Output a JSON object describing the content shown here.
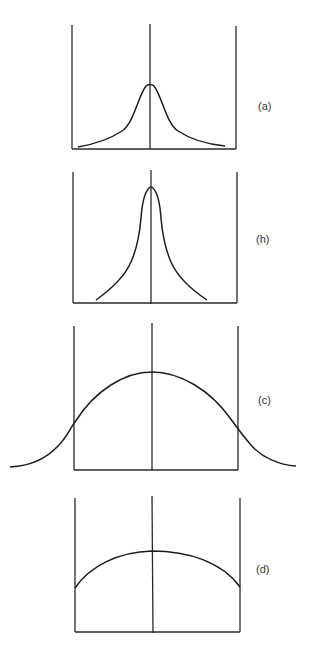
{
  "figure": {
    "colors": {
      "line": "#1e1e1e",
      "background": "#ffffff",
      "label": "#333333"
    },
    "panels": [
      {
        "id": "a",
        "label": "(a)",
        "shape": "moderately peaked, tails reaching near the walls",
        "walls": {
          "left_x": 72,
          "right_x": 236,
          "center_x": 150,
          "top_y": 25,
          "bottom_y": 149
        },
        "peak_y": 84
      },
      {
        "id": "h",
        "label": "(h)",
        "shape": "sharply peaked, narrow, tails ending before walls",
        "walls": {
          "left_x": 73,
          "right_x": 237,
          "center_x": 151,
          "top_y": 172,
          "bottom_y": 303
        },
        "peak_y": 187
      },
      {
        "id": "c",
        "label": "(c)",
        "shape": "broad bell curve extending beyond the walls",
        "walls": {
          "left_x": 74,
          "right_x": 238,
          "center_x": 152,
          "top_y": 324,
          "bottom_y": 470
        },
        "peak_y": 372
      },
      {
        "id": "d",
        "label": "(d)",
        "shape": "flat dome, truncated at walls",
        "walls": {
          "left_x": 75,
          "right_x": 240,
          "center_x": 152,
          "top_y": 498,
          "bottom_y": 632
        },
        "peak_y": 551
      }
    ]
  }
}
